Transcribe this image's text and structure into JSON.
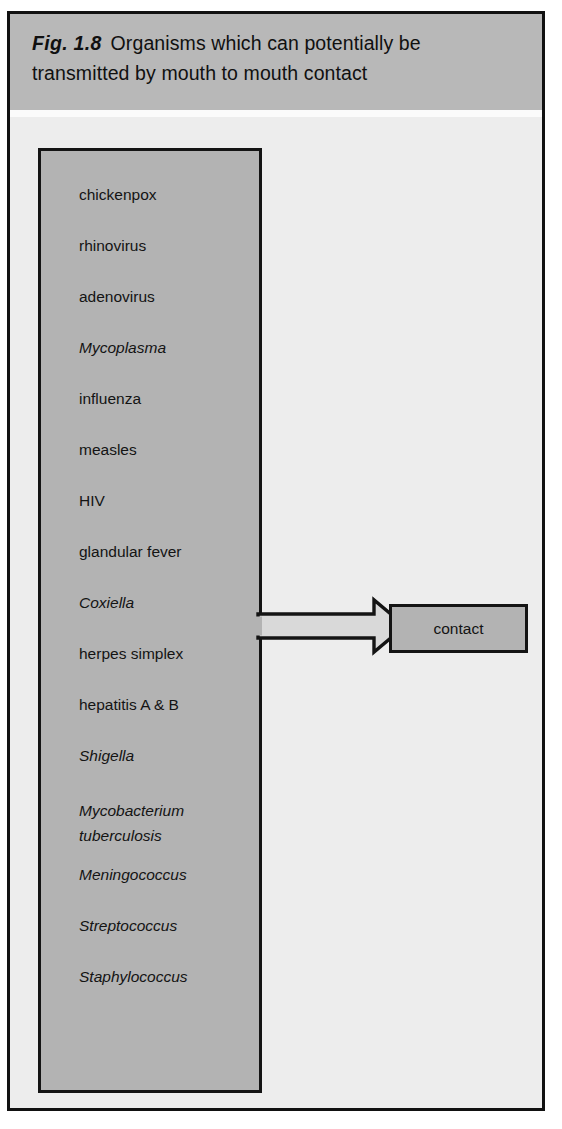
{
  "figure": {
    "label": "Fig. 1.8",
    "title": "Organisms which can potentially be transmitted by mouth to mouth contact"
  },
  "organism_box": {
    "name": "organisms-list",
    "items": [
      {
        "text": "chickenpox",
        "italic": false
      },
      {
        "text": "rhinovirus",
        "italic": false
      },
      {
        "text": "adenovirus",
        "italic": false
      },
      {
        "text": "Mycoplasma",
        "italic": true
      },
      {
        "text": "influenza",
        "italic": false
      },
      {
        "text": "measles",
        "italic": false
      },
      {
        "text": "HIV",
        "italic": false
      },
      {
        "text": "glandular fever",
        "italic": false
      },
      {
        "text": "Coxiella",
        "italic": true
      },
      {
        "text": "herpes simplex",
        "italic": false
      },
      {
        "text": "hepatitis A & B",
        "italic": false
      },
      {
        "text": "Shigella",
        "italic": true
      },
      {
        "text": "Mycobacterium\n   tuberculosis",
        "italic": true
      },
      {
        "text": "Meningococcus",
        "italic": true
      },
      {
        "text": "Streptococcus",
        "italic": true
      },
      {
        "text": "Staphylococcus",
        "italic": true
      }
    ]
  },
  "arrow": {
    "name": "transmission-arrow",
    "direction": "right"
  },
  "contact_box": {
    "label": "contact"
  },
  "colors": {
    "frame_border": "#111111",
    "header_band": "#b8b8b8",
    "body_background": "#ededed",
    "box_fill": "#b3b3b3",
    "box_border": "#141414",
    "text": "#141414",
    "arrow_fill": "#d9d9d9",
    "arrow_stroke": "#141414"
  }
}
